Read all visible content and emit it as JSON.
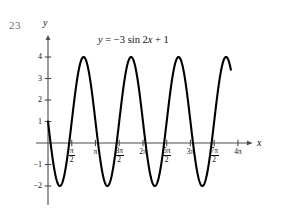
{
  "problem_number": "23",
  "equation": {
    "lhs": "y",
    "eq": " = −3 sin 2",
    "var": "x",
    "rhs": " + 1",
    "full": "y = −3 sin 2x + 1"
  },
  "axes": {
    "y_axis_label": "y",
    "x_axis_label": "x"
  },
  "chart_data": {
    "type": "line",
    "title": "y = −3 sin 2x + 1",
    "xlabel": "x",
    "ylabel": "y",
    "function": "y = -3*sin(2*x) + 1",
    "amplitude": 3,
    "period": "π",
    "midline": 1,
    "maximum": 4,
    "minimum": -2,
    "reflected": true,
    "grid": false,
    "legend": "none",
    "xlim": [
      0,
      12.566370614359172
    ],
    "ylim": [
      -2.6,
      4.6
    ],
    "x_domain_drawn": [
      0,
      12.1
    ],
    "y_ticks": [
      {
        "value": 4,
        "label": "4"
      },
      {
        "value": 3,
        "label": "3"
      },
      {
        "value": 2,
        "label": "2"
      },
      {
        "value": 1,
        "label": "1"
      },
      {
        "value": -1,
        "label": "−1"
      },
      {
        "value": -2,
        "label": "−2"
      }
    ],
    "x_ticks": [
      {
        "value": 1.5707963,
        "num": "π",
        "den": "2",
        "label": "π/2",
        "fraction": true
      },
      {
        "value": 3.1415927,
        "num": "π",
        "den": "",
        "label": "π",
        "fraction": false
      },
      {
        "value": 4.712389,
        "num": "3π",
        "den": "2",
        "label": "3π/2",
        "fraction": true
      },
      {
        "value": 6.2831853,
        "num": "2π",
        "den": "",
        "label": "2π",
        "fraction": false
      },
      {
        "value": 7.8539816,
        "num": "5π",
        "den": "2",
        "label": "5π/2",
        "fraction": true
      },
      {
        "value": 9.424778,
        "num": "3π",
        "den": "",
        "label": "3π",
        "fraction": false
      },
      {
        "value": 10.9955743,
        "num": "7π",
        "den": "2",
        "label": "7π/2",
        "fraction": true
      },
      {
        "value": 12.5663706,
        "num": "4π",
        "den": "",
        "label": "4π",
        "fraction": false
      }
    ],
    "key_points": [
      {
        "x": 0,
        "y": 1,
        "note": "start / midline"
      },
      {
        "x": 0.7853982,
        "y": -2,
        "note": "minimum"
      },
      {
        "x": 1.5707963,
        "y": 1,
        "note": "midline crossing"
      },
      {
        "x": 2.3561945,
        "y": 4,
        "note": "maximum"
      },
      {
        "x": 3.1415927,
        "y": 1,
        "note": "midline crossing"
      },
      {
        "x": 3.9269908,
        "y": -2,
        "note": "minimum"
      },
      {
        "x": 5.4977871,
        "y": 4,
        "note": "maximum"
      },
      {
        "x": 7.0685835,
        "y": -2,
        "note": "minimum"
      },
      {
        "x": 8.6393798,
        "y": 4,
        "note": "maximum"
      },
      {
        "x": 10.2101761,
        "y": -2,
        "note": "minimum"
      },
      {
        "x": 11.7809725,
        "y": 4,
        "note": "maximum"
      },
      {
        "x": 12.1,
        "y": 1.0,
        "note": "curve end"
      }
    ],
    "colors": {
      "curve": "#000000",
      "axis": "#4a4a4a",
      "text": "#111111",
      "problem_number": "#6b6b6b",
      "background": "#ffffff"
    }
  }
}
